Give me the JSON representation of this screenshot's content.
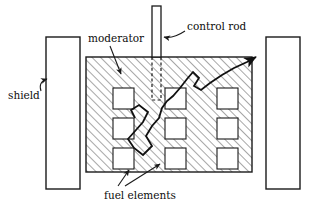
{
  "figure": {
    "width": 309,
    "height": 208,
    "background_color": "#ffffff",
    "line_color": "#1a1a1a",
    "hatch_color": "#8a8a8a",
    "fill_white": "#ffffff"
  },
  "labels": {
    "shield": "shield",
    "moderator": "moderator",
    "control_rod": "control rod",
    "fuel_elements": "fuel elements"
  },
  "components": {
    "shield_left": {
      "name": "shield",
      "x": 46,
      "y": 37,
      "width": 34,
      "height": 152,
      "fill": "#ffffff",
      "stroke": "#1a1a1a"
    },
    "shield_right": {
      "name": "shield",
      "x": 266,
      "y": 37,
      "width": 34,
      "height": 152,
      "fill": "#ffffff",
      "stroke": "#1a1a1a"
    },
    "moderator_block": {
      "name": "moderator",
      "x": 86,
      "y": 57,
      "width": 166,
      "height": 115,
      "fill": "hatched-45",
      "stroke": "#1a1a1a"
    },
    "control_rod": {
      "name": "control rod",
      "x": 152,
      "y": 6,
      "width": 9,
      "height": 51,
      "inserted_x": 152,
      "inserted_y": 57,
      "inserted_width": 9,
      "inserted_height": 43,
      "stroke": "#1a1a1a",
      "inserted_style": "dashed"
    },
    "fuel_elements": {
      "name": "fuel elements",
      "count": 9,
      "rows": 3,
      "cols": 3,
      "size": 21,
      "fill": "#ffffff",
      "stroke": "#1a1a1a",
      "positions": [
        {
          "x": 113,
          "y": 88
        },
        {
          "x": 165,
          "y": 88
        },
        {
          "x": 217,
          "y": 88
        },
        {
          "x": 113,
          "y": 118
        },
        {
          "x": 165,
          "y": 118
        },
        {
          "x": 217,
          "y": 118
        },
        {
          "x": 113,
          "y": 148
        },
        {
          "x": 165,
          "y": 148
        },
        {
          "x": 217,
          "y": 148
        }
      ]
    },
    "neutron_path": {
      "name": "neutron scattering path",
      "stroke": "#111111",
      "stroke_width": 1.8,
      "arrowhead": "end",
      "points": "135,118 131,110 139,105 148,112 143,122 136,130 128,139 134,148 143,155 152,146 146,136 152,126 159,118 162,108 167,101 173,96 180,88 187,79 193,72 199,78 194,86 201,90 210,83 222,75 234,68 247,62 256,57"
    }
  },
  "annotations": [
    {
      "name": "shield-label",
      "text": "shield",
      "text_x": 8,
      "text_y": 96,
      "leader": "M 41 91 Q 39 83 47 80"
    },
    {
      "name": "moderator-label",
      "text": "moderator",
      "text_x": 88,
      "text_y": 42,
      "leader": "M 110 46 L 121 74"
    },
    {
      "name": "control-rod-label",
      "text": "control rod",
      "text_x": 186,
      "text_y": 29,
      "leader": "M 184 32 Q 172 38 162 37"
    },
    {
      "name": "fuel-elements-label",
      "text": "fuel elements",
      "text_x": 104,
      "text_y": 198,
      "leader_a": "M 117 186 L 128 169",
      "leader_b": "M 124 186 L 159 163"
    }
  ]
}
